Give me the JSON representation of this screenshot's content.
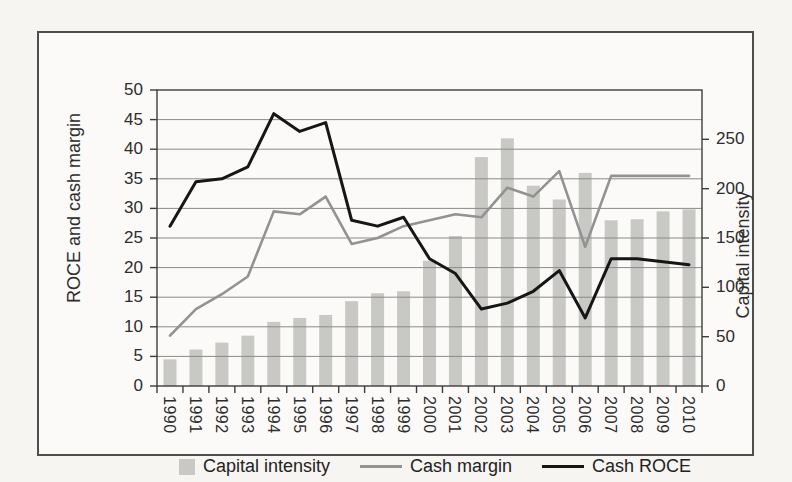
{
  "figure": {
    "legend": [
      {
        "label": "Capital intensity",
        "swatch": "bar-square",
        "color": "#c8c9c5"
      },
      {
        "label": "Cash margin",
        "swatch": "line",
        "color": "#929292"
      },
      {
        "label": "Cash ROCE",
        "swatch": "line",
        "color": "#161616"
      }
    ]
  },
  "chart_data": {
    "type": "combo-bar-line",
    "title": "",
    "categories": [
      1990,
      1991,
      1992,
      1993,
      1994,
      1995,
      1996,
      1997,
      1998,
      1999,
      2000,
      2001,
      2002,
      2003,
      2004,
      2005,
      2006,
      2007,
      2008,
      2009,
      2010
    ],
    "series": [
      {
        "name": "Capital intensity",
        "type": "bar",
        "axis": "right",
        "color": "#c8c9c5",
        "values": [
          27,
          37,
          44,
          51,
          65,
          69,
          72,
          86,
          94,
          96,
          127,
          152,
          232,
          251,
          203,
          189,
          216,
          168,
          169,
          177,
          179
        ]
      },
      {
        "name": "Cash margin",
        "type": "line",
        "axis": "left",
        "color": "#929292",
        "values": [
          8.5,
          13,
          15.5,
          18.5,
          29.5,
          29,
          32,
          24,
          25,
          27,
          28,
          29,
          28.5,
          33.5,
          32,
          36.3,
          23.5,
          35.5,
          35.5,
          35.5,
          35.5
        ]
      },
      {
        "name": "Cash ROCE",
        "type": "line",
        "axis": "left",
        "color": "#161616",
        "values": [
          27,
          34.5,
          35,
          37,
          46,
          43,
          44.5,
          28,
          27,
          28.5,
          21.5,
          19,
          13,
          14,
          16,
          19.5,
          11.5,
          21.5,
          21.5,
          21,
          20.5
        ]
      }
    ],
    "left_axis": {
      "title": "ROCE and cash margin",
      "min": 0,
      "max": 50,
      "tick_step": 5,
      "tick_labels": [
        "0",
        "5",
        "10",
        "15",
        "20",
        "25",
        "30",
        "35",
        "40",
        "45",
        "50"
      ]
    },
    "right_axis": {
      "title": "Capital intensity",
      "min": 0,
      "max": 300,
      "tick_step": 50,
      "tick_labels": [
        "0",
        "50",
        "100",
        "150",
        "200",
        "250"
      ]
    },
    "x_axis": {
      "label_rotation_deg": 90
    },
    "grid": true,
    "legend_position": "bottom"
  }
}
